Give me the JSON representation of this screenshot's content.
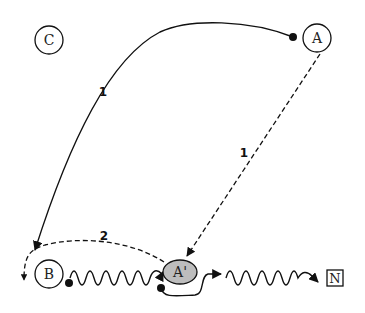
{
  "diagram": {
    "nodes": {
      "C": {
        "label": "C",
        "shape": "circle"
      },
      "A": {
        "label": "A",
        "shape": "circle"
      },
      "B": {
        "label": "B",
        "shape": "circle"
      },
      "A_prime": {
        "label": "A'",
        "shape": "ellipse",
        "fill": "#bdbdbd"
      },
      "N": {
        "label": "N",
        "shape": "square"
      }
    },
    "edges": [
      {
        "id": "edge-a-to-b",
        "from": "A",
        "to": "B",
        "style": "solid-curve",
        "label": "1"
      },
      {
        "id": "edge-a-to-aprime",
        "from": "A",
        "to": "A'",
        "style": "dashed",
        "label": "1"
      },
      {
        "id": "edge-aprime-to-b-left",
        "from": "A'",
        "to": "left of B",
        "style": "dashed-curve",
        "label": "2"
      },
      {
        "id": "edge-b-to-aprime",
        "from": "B",
        "to": "A'",
        "style": "wavy"
      },
      {
        "id": "edge-aprime-to-n",
        "from": "A'",
        "to": "N",
        "style": "wavy"
      }
    ],
    "colors": {
      "stroke": "#111111",
      "aprime_fill": "#bdbdbd",
      "background": "#ffffff"
    }
  }
}
